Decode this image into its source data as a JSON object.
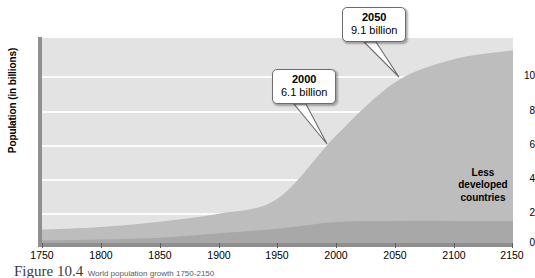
{
  "figure": {
    "caption_label": "Figure 10.4",
    "caption_text": "World population growth 1750-2150"
  },
  "chart_data": {
    "type": "area",
    "title": "",
    "xlabel": "",
    "ylabel": "Population (in billions)",
    "xlim": [
      1750,
      2150
    ],
    "ylim": [
      0,
      11.6
    ],
    "grid": true,
    "stacked": true,
    "legend_position": "in-plot",
    "xticks": [
      1750,
      1800,
      1850,
      1900,
      1950,
      2000,
      2050,
      2100,
      2150
    ],
    "yticks": [
      0,
      2,
      4,
      6,
      8,
      10
    ],
    "x": [
      1750,
      1800,
      1850,
      1900,
      1950,
      2000,
      2050,
      2100,
      2150
    ],
    "series": [
      {
        "name": "More developed countries",
        "color": "#a8a8a8",
        "values": [
          0.15,
          0.2,
          0.3,
          0.55,
          0.81,
          1.19,
          1.25,
          1.25,
          1.25
        ]
      },
      {
        "name": "Less developed countries",
        "color": "#bdbdbd",
        "values": [
          0.6,
          0.7,
          0.9,
          1.1,
          1.7,
          4.9,
          7.85,
          9.15,
          9.65
        ]
      }
    ],
    "totals": [
      0.75,
      0.9,
      1.2,
      1.65,
      2.51,
      6.1,
      9.1,
      10.4,
      10.9
    ],
    "annotations": [
      {
        "year": "2000",
        "value": "6.1 billion",
        "x": 2000,
        "y": 6.1
      },
      {
        "year": "2050",
        "value": "9.1 billion",
        "x": 2050,
        "y": 9.1
      }
    ],
    "area_labels": [
      "Less developed countries",
      "More developed countries"
    ],
    "colors": {
      "plot_background": "#e3e3e3",
      "gridline": "#fbfbfb",
      "axis": "#8f8f8f",
      "less_developed": "#bdbdbd",
      "more_developed": "#a8a8a8",
      "callout_border": "#6d6d6d"
    }
  }
}
